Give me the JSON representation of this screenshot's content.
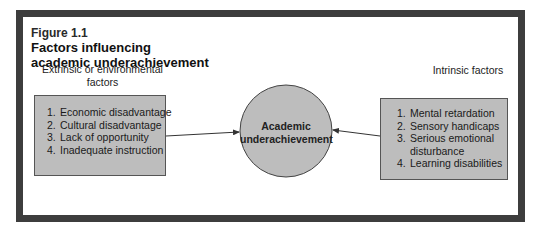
{
  "figure": {
    "label": "Figure 1.1",
    "title_line1": "Factors influencing",
    "title_line2": "academic underachievement"
  },
  "left_group": {
    "heading_line1": "Extrinsic or environmental",
    "heading_line2": "factors",
    "items": [
      {
        "num": "1.",
        "text": "Economic disadvantage"
      },
      {
        "num": "2.",
        "text": "Cultural disadvantage"
      },
      {
        "num": "3.",
        "text": "Lack of opportunity"
      },
      {
        "num": "4.",
        "text": "Inadequate instruction"
      }
    ]
  },
  "right_group": {
    "heading": "Intrinsic factors",
    "items": [
      {
        "num": "1.",
        "text": "Mental retardation"
      },
      {
        "num": "2.",
        "text": "Sensory handicaps"
      },
      {
        "num": "3.",
        "text": "Serious emotional disturbance"
      },
      {
        "num": "4.",
        "text": "Learning disabilities"
      }
    ]
  },
  "center": {
    "line1": "Academic",
    "line2": "underachievement"
  },
  "colors": {
    "frame": "#3d3d3d",
    "box_fill": "#bdbdbd",
    "circle_fill": "#bdbdbd",
    "arrow": "#333333"
  }
}
